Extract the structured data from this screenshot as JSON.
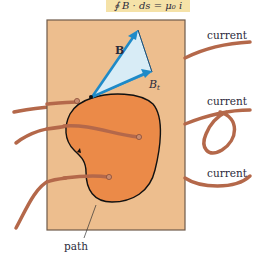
{
  "equation": {
    "text": "∮ B · ds = μ₀ i",
    "box_color": "#F5E2A8"
  },
  "vectors": {
    "b_label": "B",
    "bt_label": "B",
    "bt_subscript": "t",
    "color": "#1E8AC8",
    "fill": "#D8ECF6"
  },
  "labels": {
    "current_1": "current",
    "current_2": "current",
    "current_3": "current",
    "path": "path"
  },
  "colors": {
    "plane": "#EDBE8E",
    "plane_border": "#6E5A4A",
    "region": "#EB8A48",
    "wire": "#B4684A",
    "outline": "#111111"
  }
}
